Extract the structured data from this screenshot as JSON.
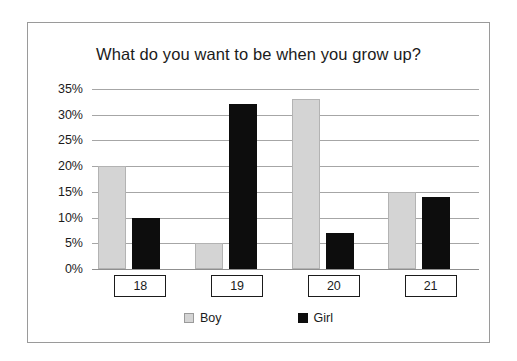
{
  "chart_data": {
    "type": "bar",
    "title": "What do you want to be when you grow up?",
    "xlabel": "",
    "ylabel": "",
    "categories": [
      "18",
      "19",
      "20",
      "21"
    ],
    "series": [
      {
        "name": "Boy",
        "color": "#d4d4d4",
        "values": [
          20,
          5,
          33,
          15
        ]
      },
      {
        "name": "Girl",
        "color": "#0d0d0d",
        "values": [
          10,
          32,
          7,
          14
        ]
      }
    ],
    "ylim": [
      0,
      35
    ],
    "ytick_values": [
      0,
      5,
      10,
      15,
      20,
      25,
      30,
      35
    ],
    "ytick_labels": [
      "0%",
      "5%",
      "10%",
      "15%",
      "20%",
      "25%",
      "30%",
      "35%"
    ],
    "grid": true,
    "legend_position": "bottom",
    "value_suffix": "%"
  },
  "legend": {
    "entries": [
      {
        "label": "Boy"
      },
      {
        "label": "Girl"
      }
    ]
  },
  "colors": {
    "boy": "#d4d4d4",
    "girl": "#0d0d0d",
    "gridline": "#a6a6a6",
    "frame": "#9a9a9a",
    "text": "#1b1b1b"
  }
}
